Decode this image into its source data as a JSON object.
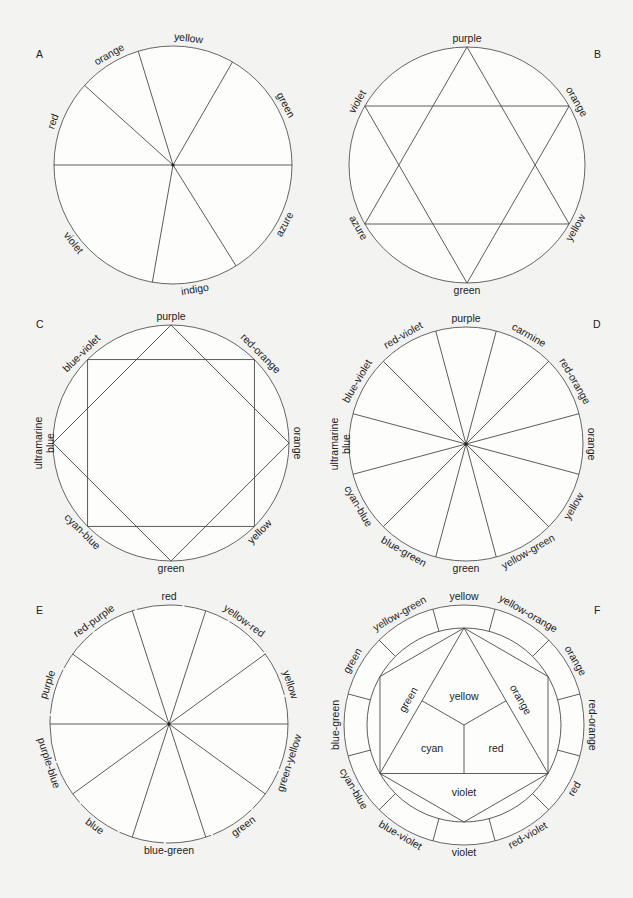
{
  "figure": {
    "panels": [
      {
        "id": "A",
        "letter": "A",
        "letter_pos": [
          36,
          58
        ],
        "cx": 173,
        "cy": 165,
        "r": 119,
        "type": "spokes",
        "center_dot": true,
        "spokes": [
          -17,
          30,
          90,
          148,
          190,
          270,
          312
        ],
        "labels": [
          {
            "text": "yellow",
            "angle": 7
          },
          {
            "text": "green",
            "angle": 62
          },
          {
            "text": "azure",
            "angle": 118
          },
          {
            "text": "indigo",
            "angle": 170
          },
          {
            "text": "violet",
            "angle": 232
          },
          {
            "text": "red",
            "angle": 290
          },
          {
            "text": "orange",
            "angle": 330
          }
        ]
      },
      {
        "id": "B",
        "letter": "B",
        "letter_pos": [
          594,
          58
        ],
        "cx": 467,
        "cy": 165,
        "r": 118,
        "type": "star",
        "triangles": [
          [
            0,
            120,
            240
          ],
          [
            60,
            180,
            300
          ]
        ],
        "labels": [
          {
            "text": "purple",
            "angle": 0
          },
          {
            "text": "orange",
            "angle": 60
          },
          {
            "text": "yellow",
            "angle": 120
          },
          {
            "text": "green",
            "angle": 180
          },
          {
            "text": "azure",
            "angle": 240
          },
          {
            "text": "violet",
            "angle": 300
          }
        ]
      },
      {
        "id": "C",
        "letter": "C",
        "letter_pos": [
          36,
          328
        ],
        "cx": 171,
        "cy": 443,
        "r": 118,
        "type": "square-diamond",
        "polygons": [
          [
            0,
            90,
            180,
            270
          ],
          [
            45,
            135,
            225,
            315
          ]
        ],
        "labels": [
          {
            "text": "purple",
            "angle": 0
          },
          {
            "text": "red-orange",
            "angle": 45
          },
          {
            "text": "orange",
            "angle": 90
          },
          {
            "text": "yellow",
            "angle": 135
          },
          {
            "text": "green",
            "angle": 180
          },
          {
            "text": "cyan-blue",
            "angle": 225
          },
          {
            "text": "ultramarine|blue",
            "angle": 270
          },
          {
            "text": "blue-violet",
            "angle": 315
          }
        ]
      },
      {
        "id": "D",
        "letter": "D",
        "letter_pos": [
          593,
          328
        ],
        "cx": 466,
        "cy": 444,
        "r": 117,
        "type": "spokes",
        "center_dot": true,
        "spokes": [
          15,
          45,
          75,
          105,
          135,
          165,
          195,
          225,
          255,
          285,
          315,
          345
        ],
        "labels": [
          {
            "text": "purple",
            "angle": 0
          },
          {
            "text": "carmine",
            "angle": 30
          },
          {
            "text": "red-orange",
            "angle": 60
          },
          {
            "text": "orange",
            "angle": 90
          },
          {
            "text": "yellow",
            "angle": 120
          },
          {
            "text": "yellow-green",
            "angle": 150
          },
          {
            "text": "green",
            "angle": 180
          },
          {
            "text": "blue-green",
            "angle": 210
          },
          {
            "text": "cyan-blue",
            "angle": 240
          },
          {
            "text": "ultramarine|blue",
            "angle": 270
          },
          {
            "text": "blue-violet",
            "angle": 300
          },
          {
            "text": "red-violet",
            "angle": 330
          }
        ]
      },
      {
        "id": "E",
        "letter": "E",
        "letter_pos": [
          36,
          614
        ],
        "cx": 169,
        "cy": 724,
        "r": 119,
        "type": "spokes",
        "center_dot": true,
        "dashed_circle": true,
        "spokes": [
          18,
          54,
          90,
          126,
          162,
          198,
          234,
          270,
          306,
          342
        ],
        "labels": [
          {
            "text": "red",
            "angle": 0
          },
          {
            "text": "yellow-red",
            "angle": 36
          },
          {
            "text": "yellow",
            "angle": 72
          },
          {
            "text": "green-yellow",
            "angle": 108
          },
          {
            "text": "green",
            "angle": 144
          },
          {
            "text": "blue-green",
            "angle": 180
          },
          {
            "text": "blue",
            "angle": 216
          },
          {
            "text": "purple-blue",
            "angle": 252
          },
          {
            "text": "purple",
            "angle": 288
          },
          {
            "text": "red-purple",
            "angle": 324
          }
        ]
      },
      {
        "id": "F",
        "letter": "F",
        "letter_pos": [
          594,
          614
        ],
        "cx": 464,
        "cy": 725,
        "r": 120,
        "inner_r": 97,
        "type": "itten",
        "ring_dividers": [
          15,
          45,
          75,
          105,
          135,
          165,
          195,
          225,
          255,
          285,
          315,
          345
        ],
        "labels": [
          {
            "text": "yellow",
            "angle": 0
          },
          {
            "text": "yellow-orange",
            "angle": 30
          },
          {
            "text": "orange",
            "angle": 60
          },
          {
            "text": "red-orange",
            "angle": 90
          },
          {
            "text": "red",
            "angle": 120
          },
          {
            "text": "red-violet",
            "angle": 150
          },
          {
            "text": "violet",
            "angle": 180
          },
          {
            "text": "blue-violet",
            "angle": 210
          },
          {
            "text": "cyan-blue",
            "angle": 240
          },
          {
            "text": "blue-green",
            "angle": 270
          },
          {
            "text": "green",
            "angle": 300
          },
          {
            "text": "yellow-green",
            "angle": 330
          }
        ],
        "inner_labels": [
          {
            "text": "yellow",
            "x": 464,
            "y": 697,
            "rot": 0
          },
          {
            "text": "cyan",
            "x": 432,
            "y": 749,
            "rot": 0
          },
          {
            "text": "red",
            "x": 496,
            "y": 749,
            "rot": 0
          },
          {
            "text": "violet",
            "x": 464,
            "y": 793,
            "rot": 0
          },
          {
            "text": "green",
            "x": 409,
            "y": 700,
            "rot": -60
          },
          {
            "text": "orange",
            "x": 520,
            "y": 700,
            "rot": 60
          }
        ]
      }
    ]
  },
  "style": {
    "background": "#f3f3f1",
    "line_color": "#4a4a4a",
    "circle_fill": "#fdfdfc",
    "text_color": "#222222"
  }
}
